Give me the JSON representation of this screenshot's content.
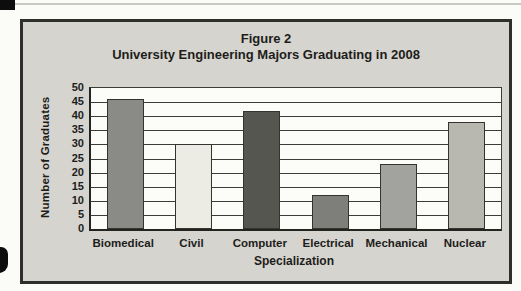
{
  "figure": {
    "title": "Figure 2",
    "subtitle": "University Engineering Majors Graduating in 2008"
  },
  "chart_data": {
    "type": "bar",
    "title": "Figure 2",
    "subtitle": "University Engineering Majors Graduating in 2008",
    "categories": [
      "Biomedical",
      "Civil",
      "Computer",
      "Electrical",
      "Mechanical",
      "Nuclear"
    ],
    "values": [
      46,
      30,
      42,
      12,
      23,
      38
    ],
    "bar_colors": [
      "#8a8a86",
      "#edece4",
      "#565650",
      "#7e7e7a",
      "#a2a29e",
      "#b8b8b1"
    ],
    "xlabel": "Specialization",
    "ylabel": "Number of Graduates",
    "ylim": [
      0,
      50
    ],
    "yticks": [
      0,
      5,
      10,
      15,
      20,
      25,
      30,
      35,
      40,
      45,
      50
    ],
    "grid": "horizontal gridline at every y tick",
    "legend": "none",
    "colors": {
      "panel_background": "#d6d4ce",
      "plot_background": "#fcfcf9",
      "border": "#2e2e2a",
      "text": "#1d1d1b"
    }
  }
}
